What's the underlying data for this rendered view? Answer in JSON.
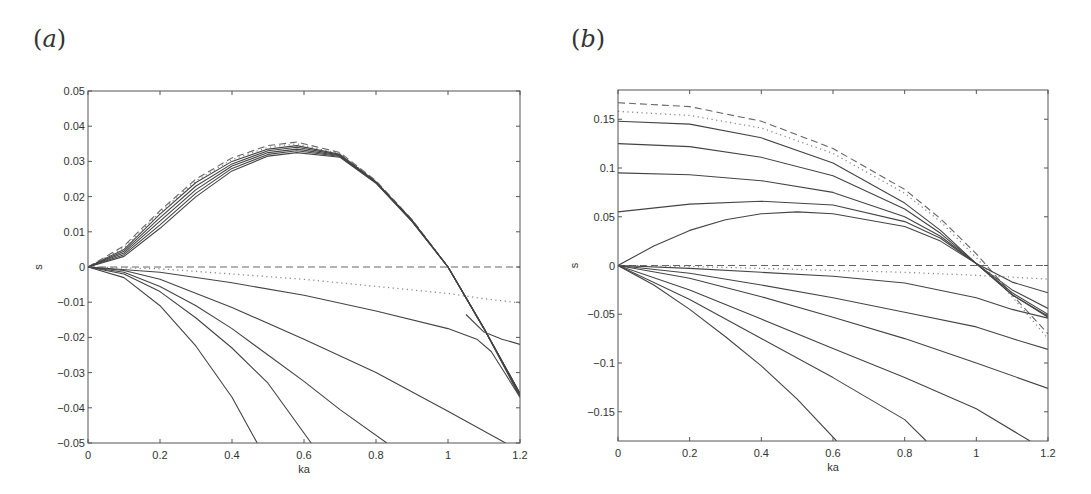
{
  "chart_data": [
    {
      "panel": "(a)",
      "type": "line",
      "xlabel": "ka",
      "ylabel": "s",
      "xlim": [
        0,
        1.2
      ],
      "ylim": [
        -0.05,
        0.05
      ],
      "xticks": [
        "0",
        "0.2",
        "0.4",
        "0.6",
        "0.8",
        "1",
        "1.2"
      ],
      "yticks": [
        "0.05",
        "0.04",
        "0.03",
        "0.02",
        "0.01",
        "0",
        "-0.01",
        "-0.02",
        "-0.03",
        "-0.04",
        "-0.05"
      ],
      "grid": false,
      "series": [
        {
          "name": "upper-dashed",
          "style": "dashed",
          "x": [
            0,
            0.1,
            0.2,
            0.3,
            0.4,
            0.5,
            0.58,
            0.7,
            0.8,
            0.9,
            1.0,
            1.1,
            1.2
          ],
          "y": [
            0,
            0.006,
            0.016,
            0.025,
            0.031,
            0.0345,
            0.0355,
            0.0325,
            0.0245,
            0.0135,
            0.0,
            -0.0175,
            -0.036
          ]
        },
        {
          "name": "upper-dotted",
          "style": "dotted",
          "x": [
            0,
            0.1,
            0.2,
            0.3,
            0.4,
            0.5,
            0.58,
            0.7,
            0.8,
            0.9,
            1.0,
            1.1,
            1.2
          ],
          "y": [
            0,
            0.0055,
            0.0155,
            0.0245,
            0.0305,
            0.034,
            0.035,
            0.0322,
            0.0243,
            0.0134,
            0.0,
            -0.0175,
            -0.036
          ]
        },
        {
          "name": "upper-solid-1",
          "style": "solid",
          "x": [
            0,
            0.1,
            0.2,
            0.3,
            0.4,
            0.5,
            0.58,
            0.7,
            0.8,
            0.9,
            1.0,
            1.1,
            1.2
          ],
          "y": [
            0,
            0.005,
            0.015,
            0.024,
            0.03,
            0.0335,
            0.0345,
            0.032,
            0.0242,
            0.0133,
            0.0,
            -0.0175,
            -0.036
          ]
        },
        {
          "name": "upper-solid-2",
          "style": "solid",
          "x": [
            0,
            0.1,
            0.2,
            0.3,
            0.4,
            0.5,
            0.58,
            0.7,
            0.8,
            0.9,
            1.0,
            1.1,
            1.2
          ],
          "y": [
            0,
            0.0045,
            0.014,
            0.023,
            0.0293,
            0.033,
            0.034,
            0.0318,
            0.0241,
            0.0132,
            0.0,
            -0.0175,
            -0.036
          ]
        },
        {
          "name": "upper-solid-3",
          "style": "solid",
          "x": [
            0,
            0.1,
            0.2,
            0.3,
            0.4,
            0.5,
            0.58,
            0.7,
            0.8,
            0.9,
            1.0,
            1.1,
            1.2
          ],
          "y": [
            0,
            0.004,
            0.013,
            0.022,
            0.0287,
            0.0325,
            0.0335,
            0.0316,
            0.024,
            0.0131,
            0.0,
            -0.0175,
            -0.036
          ]
        },
        {
          "name": "upper-solid-4",
          "style": "solid",
          "x": [
            0,
            0.1,
            0.2,
            0.3,
            0.4,
            0.5,
            0.58,
            0.7,
            0.8,
            0.9,
            1.0,
            1.1,
            1.2
          ],
          "y": [
            0,
            0.0035,
            0.012,
            0.021,
            0.028,
            0.032,
            0.033,
            0.0314,
            0.0239,
            0.013,
            0.0,
            -0.0175,
            -0.0365
          ]
        },
        {
          "name": "upper-solid-5",
          "style": "solid",
          "x": [
            0,
            0.1,
            0.2,
            0.3,
            0.4,
            0.5,
            0.58,
            0.7,
            0.8,
            0.9,
            1.0,
            1.1,
            1.2
          ],
          "y": [
            0,
            0.003,
            0.011,
            0.02,
            0.0273,
            0.0315,
            0.0325,
            0.0312,
            0.0238,
            0.0129,
            0.0,
            -0.0175,
            -0.037
          ]
        },
        {
          "name": "zero-dashed",
          "style": "dashed",
          "x": [
            0,
            1.2
          ],
          "y": [
            0,
            0
          ]
        },
        {
          "name": "lower-dotted",
          "style": "dotted",
          "x": [
            0,
            0.2,
            0.4,
            0.6,
            0.8,
            1.0,
            1.1,
            1.2
          ],
          "y": [
            0,
            -0.0005,
            -0.002,
            -0.0035,
            -0.0055,
            -0.0075,
            -0.009,
            -0.0102
          ]
        },
        {
          "name": "lower-solid-1",
          "style": "solid",
          "x": [
            0,
            0.2,
            0.4,
            0.6,
            0.8,
            1.0,
            1.08,
            1.12,
            1.2
          ],
          "y": [
            0,
            -0.0015,
            -0.0045,
            -0.008,
            -0.0125,
            -0.0175,
            -0.0205,
            -0.024,
            -0.037
          ]
        },
        {
          "name": "lower-solid-1b",
          "style": "solid",
          "x": [
            1.05,
            1.1,
            1.15,
            1.2
          ],
          "y": [
            -0.0135,
            -0.0185,
            -0.0205,
            -0.022
          ]
        },
        {
          "name": "lower-solid-2",
          "style": "solid",
          "x": [
            0,
            0.1,
            0.2,
            0.4,
            0.6,
            0.8,
            1.0,
            1.16
          ],
          "y": [
            0,
            -0.001,
            -0.0035,
            -0.0115,
            -0.0205,
            -0.03,
            -0.041,
            -0.05
          ]
        },
        {
          "name": "lower-solid-3",
          "style": "solid",
          "x": [
            0,
            0.1,
            0.2,
            0.3,
            0.4,
            0.5,
            0.6,
            0.7,
            0.83
          ],
          "y": [
            0,
            -0.0015,
            -0.0055,
            -0.011,
            -0.0175,
            -0.025,
            -0.0325,
            -0.0405,
            -0.05
          ]
        },
        {
          "name": "lower-solid-4",
          "style": "solid",
          "x": [
            0,
            0.1,
            0.2,
            0.3,
            0.4,
            0.5,
            0.62
          ],
          "y": [
            0,
            -0.002,
            -0.007,
            -0.0145,
            -0.023,
            -0.033,
            -0.05
          ]
        },
        {
          "name": "lower-solid-5",
          "style": "solid",
          "x": [
            0,
            0.1,
            0.2,
            0.3,
            0.4,
            0.47
          ],
          "y": [
            0,
            -0.003,
            -0.011,
            -0.0225,
            -0.037,
            -0.05
          ]
        }
      ]
    },
    {
      "panel": "(b)",
      "type": "line",
      "xlabel": "ka",
      "ylabel": "s",
      "xlim": [
        0,
        1.2
      ],
      "ylim": [
        -0.18,
        0.18
      ],
      "xticks": [
        "0",
        "0.2",
        "0.4",
        "0.6",
        "0.8",
        "1",
        "1.2"
      ],
      "yticks": [
        "0.15",
        "0.1",
        "0.05",
        "0",
        "-0.05",
        "-0.1",
        "-0.15"
      ],
      "grid": false,
      "series": [
        {
          "name": "upper-dashed",
          "style": "dashed",
          "x": [
            0,
            0.2,
            0.4,
            0.6,
            0.8,
            0.9,
            1.0,
            1.1,
            1.2
          ],
          "y": [
            0.167,
            0.163,
            0.148,
            0.12,
            0.078,
            0.048,
            0.012,
            -0.03,
            -0.07
          ]
        },
        {
          "name": "upper-dotted",
          "style": "dotted",
          "x": [
            0,
            0.2,
            0.4,
            0.6,
            0.8,
            0.9,
            1.0,
            1.1,
            1.2
          ],
          "y": [
            0.158,
            0.154,
            0.141,
            0.115,
            0.074,
            0.045,
            0.008,
            -0.032,
            -0.075
          ]
        },
        {
          "name": "upper-solid-1",
          "style": "solid",
          "x": [
            0,
            0.2,
            0.4,
            0.6,
            0.8,
            0.9,
            1.0,
            1.1,
            1.2
          ],
          "y": [
            0.148,
            0.145,
            0.131,
            0.105,
            0.064,
            0.036,
            0.002,
            -0.03,
            -0.053
          ]
        },
        {
          "name": "upper-solid-2",
          "style": "solid",
          "x": [
            0,
            0.2,
            0.4,
            0.6,
            0.8,
            0.9,
            1.0,
            1.1,
            1.2
          ],
          "y": [
            0.125,
            0.122,
            0.111,
            0.092,
            0.058,
            0.033,
            0.002,
            -0.03,
            -0.052
          ]
        },
        {
          "name": "upper-solid-3",
          "style": "solid",
          "x": [
            0,
            0.2,
            0.4,
            0.6,
            0.8,
            0.9,
            1.0,
            1.1,
            1.2
          ],
          "y": [
            0.095,
            0.093,
            0.087,
            0.075,
            0.05,
            0.03,
            0.002,
            -0.028,
            -0.05
          ]
        },
        {
          "name": "upper-solid-4",
          "style": "solid",
          "x": [
            0,
            0.2,
            0.4,
            0.6,
            0.8,
            0.9,
            1.0,
            1.1,
            1.2
          ],
          "y": [
            0.055,
            0.063,
            0.066,
            0.062,
            0.045,
            0.028,
            0.002,
            -0.025,
            -0.044
          ]
        },
        {
          "name": "upper-solid-5",
          "style": "solid",
          "x": [
            0,
            0.1,
            0.2,
            0.3,
            0.4,
            0.5,
            0.6,
            0.8,
            0.9,
            1.0,
            1.1,
            1.2
          ],
          "y": [
            0,
            0.02,
            0.036,
            0.047,
            0.053,
            0.055,
            0.053,
            0.04,
            0.025,
            0.002,
            -0.017,
            -0.028
          ]
        },
        {
          "name": "zero-dashed",
          "style": "dashed",
          "x": [
            0,
            1.2
          ],
          "y": [
            0,
            0
          ]
        },
        {
          "name": "lower-dotted",
          "style": "dotted",
          "x": [
            0,
            0.2,
            0.4,
            0.6,
            0.8,
            1.0,
            1.1,
            1.2
          ],
          "y": [
            0,
            -0.001,
            -0.003,
            -0.005,
            -0.007,
            -0.01,
            -0.012,
            -0.014
          ]
        },
        {
          "name": "lower-solid-1",
          "style": "solid",
          "x": [
            0,
            0.2,
            0.4,
            0.6,
            0.8,
            1.0,
            1.1,
            1.2
          ],
          "y": [
            0,
            -0.003,
            -0.007,
            -0.011,
            -0.018,
            -0.033,
            -0.045,
            -0.054
          ]
        },
        {
          "name": "lower-solid-2",
          "style": "solid",
          "x": [
            0,
            0.2,
            0.4,
            0.6,
            0.8,
            1.0,
            1.1,
            1.2
          ],
          "y": [
            0,
            -0.008,
            -0.02,
            -0.033,
            -0.048,
            -0.063,
            -0.075,
            -0.086
          ]
        },
        {
          "name": "lower-solid-3",
          "style": "solid",
          "x": [
            0,
            0.2,
            0.4,
            0.6,
            0.8,
            1.0,
            1.2
          ],
          "y": [
            0,
            -0.013,
            -0.032,
            -0.053,
            -0.075,
            -0.1,
            -0.126
          ]
        },
        {
          "name": "lower-solid-4",
          "style": "solid",
          "x": [
            0,
            0.2,
            0.4,
            0.6,
            0.8,
            1.0,
            1.15
          ],
          "y": [
            0,
            -0.025,
            -0.055,
            -0.085,
            -0.115,
            -0.147,
            -0.18
          ]
        },
        {
          "name": "lower-solid-5",
          "style": "solid",
          "x": [
            0,
            0.2,
            0.4,
            0.6,
            0.8,
            0.86
          ],
          "y": [
            0,
            -0.035,
            -0.075,
            -0.115,
            -0.158,
            -0.18
          ]
        },
        {
          "name": "lower-solid-6",
          "style": "solid",
          "x": [
            0,
            0.1,
            0.2,
            0.3,
            0.4,
            0.5,
            0.61
          ],
          "y": [
            0,
            -0.02,
            -0.045,
            -0.073,
            -0.103,
            -0.137,
            -0.18
          ]
        }
      ]
    }
  ],
  "panels": {
    "a": {
      "label": "a"
    },
    "b": {
      "label": "b"
    }
  },
  "layout": {
    "a": {
      "left": 88,
      "right": 520,
      "top": 91,
      "bottom": 443
    },
    "b": {
      "left": 618,
      "right": 1048,
      "top": 90,
      "bottom": 441
    }
  },
  "colors": {
    "axis": "#555555",
    "line": "#444444",
    "text": "#333333"
  }
}
